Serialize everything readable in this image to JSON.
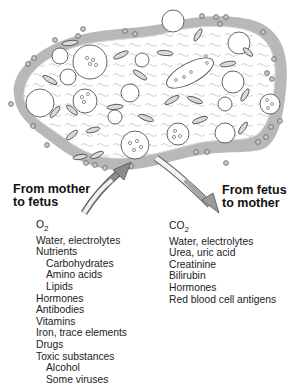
{
  "diagram": {
    "colors": {
      "maternal_blood": "#b3b3b3",
      "villus_stroma": "#ffffff",
      "cell_outline": "#555555",
      "arrow_in": "#8a8a8a",
      "arrow_out": "#bdbdbd"
    }
  },
  "left_panel": {
    "heading_line1": "From mother",
    "heading_line2": "to fetus",
    "items": [
      {
        "label": "O",
        "subscript": "2",
        "indent": 0
      },
      {
        "label": "Water, electrolytes",
        "indent": 0
      },
      {
        "label": "Nutrients",
        "indent": 0
      },
      {
        "label": "Carbohydrates",
        "indent": 1
      },
      {
        "label": "Amino acids",
        "indent": 1
      },
      {
        "label": "Lipids",
        "indent": 1
      },
      {
        "label": "Hormones",
        "indent": 0
      },
      {
        "label": "Antibodies",
        "indent": 0
      },
      {
        "label": "Vitamins",
        "indent": 0
      },
      {
        "label": "Iron, trace elements",
        "indent": 0
      },
      {
        "label": "Drugs",
        "indent": 0
      },
      {
        "label": "Toxic substances",
        "indent": 0
      },
      {
        "label": "Alcohol",
        "indent": 1
      },
      {
        "label": "Some viruses",
        "indent": 1
      }
    ]
  },
  "right_panel": {
    "heading_line1": "From fetus",
    "heading_line2": "to mother",
    "items": [
      {
        "label": "CO",
        "subscript": "2",
        "indent": 0
      },
      {
        "label": "Water, electrolytes",
        "indent": 0
      },
      {
        "label": "Urea, uric acid",
        "indent": 0
      },
      {
        "label": "Creatinine",
        "indent": 0
      },
      {
        "label": "Bilirubin",
        "indent": 0
      },
      {
        "label": "Hormones",
        "indent": 0
      },
      {
        "label": "Red blood cell antigens",
        "indent": 0
      }
    ]
  }
}
